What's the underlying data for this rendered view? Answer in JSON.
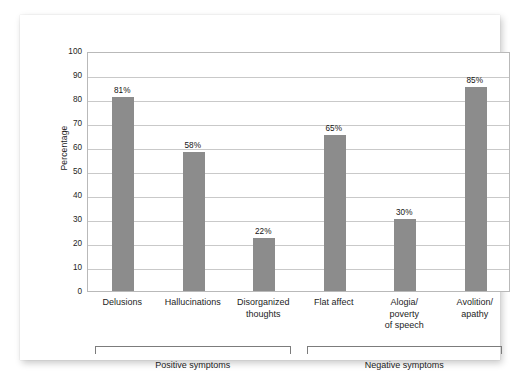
{
  "chart_data": {
    "type": "bar",
    "title": "",
    "subtitle": "",
    "xlabel": "",
    "ylabel": "Percentage",
    "ylim": [
      0,
      100
    ],
    "ytick_step": 10,
    "yticks": [
      100,
      90,
      80,
      70,
      60,
      50,
      40,
      30,
      20,
      10,
      0
    ],
    "ytick_labels": [
      "100",
      "90",
      "80",
      "70",
      "60",
      "50",
      "40",
      "30",
      "20",
      "10",
      "0"
    ],
    "grid": true,
    "grid_axis": "y",
    "legend": "none",
    "bar_color": "#8c8c8c",
    "categories": [
      "Delusions",
      "Hallucinations",
      "Disorganized\nthoughts",
      "Flat affect",
      "Alogia/\npoverty\nof speech",
      "Avolition/\napathy"
    ],
    "values": [
      81,
      58,
      22,
      65,
      30,
      85
    ],
    "value_labels": [
      "81%",
      "58%",
      "22%",
      "65%",
      "30%",
      "85%"
    ],
    "groups": [
      {
        "label": "Positive symptoms",
        "categories": [
          0,
          1,
          2
        ]
      },
      {
        "label": "Negative symptoms",
        "categories": [
          3,
          4,
          5
        ]
      }
    ]
  }
}
